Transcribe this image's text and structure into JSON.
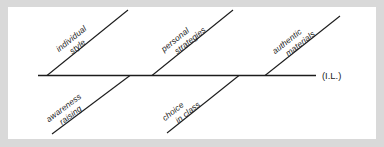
{
  "figure": {
    "type": "fishbone-diagram",
    "background_color": "#d9d9d9",
    "panel_color": "#ffffff",
    "line_color": "#1c1c1c",
    "spine": {
      "end_label": "(I.L.)"
    },
    "branches": [
      {
        "id": "individual-style",
        "position": "top",
        "line1": "individual",
        "line2": "style"
      },
      {
        "id": "personal-strategies",
        "position": "top",
        "line1": "personal",
        "line2": "strategies"
      },
      {
        "id": "authentic-materials",
        "position": "top",
        "line1": "authentic",
        "line2": "materials"
      },
      {
        "id": "awareness-raising",
        "position": "bottom",
        "line1": "awareness",
        "line2": "raising"
      },
      {
        "id": "choice-in-class",
        "position": "bottom",
        "line1": "choice",
        "line2": "in class"
      }
    ]
  }
}
